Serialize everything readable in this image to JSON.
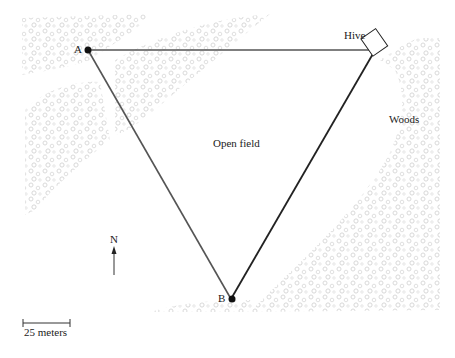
{
  "map": {
    "labels": {
      "a": "A",
      "b": "B",
      "hive": "Hive",
      "woods": "Woods",
      "open_field": "Open field",
      "north": "N",
      "scale": "25 meters"
    },
    "points": {
      "A": [
        88,
        50
      ],
      "B": [
        231,
        299
      ],
      "Hive": [
        374,
        50
      ]
    },
    "colors": {
      "line": "#444444",
      "woods_texture": "#d9d9d9",
      "text": "#222222"
    }
  }
}
